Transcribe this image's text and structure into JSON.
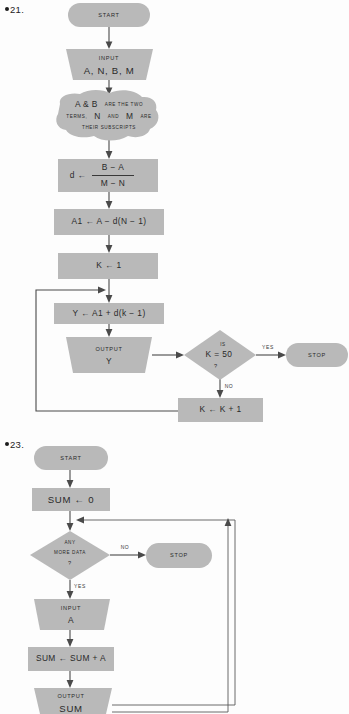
{
  "page": {
    "width": 349,
    "height": 714,
    "background": "#fdfdfd",
    "shape_fill": "#b9b9b9",
    "connector_color": "#4a4a4a",
    "text_color": "#2a2a2a"
  },
  "problems": [
    {
      "number": "21.",
      "bullet": "●",
      "nodes": {
        "start": {
          "label": "START",
          "shape": "terminator"
        },
        "input": {
          "line1": "INPUT",
          "line2": "A, N, B, M",
          "shape": "trapezoid-io"
        },
        "annotation": {
          "line1_a": "A & B",
          "line1_b": "ARE THE TWO",
          "line2_a": "TERMS,",
          "line2_b": "N",
          "line2_c": "AND",
          "line2_d": "M",
          "line2_e": "ARE",
          "line3": "THEIR SUBSCRIPTS",
          "shape": "blob"
        },
        "formula_d": {
          "lhs": "d ←",
          "numerator": "B − A",
          "denominator": "M − N",
          "shape": "process"
        },
        "assign_a1": {
          "label": "A1 ← A − d(N − 1)",
          "shape": "process"
        },
        "init_k": {
          "label": "K ← 1",
          "shape": "process"
        },
        "compute_y": {
          "label": "Y ← A1 + d(k − 1)",
          "shape": "process"
        },
        "output_y": {
          "line1": "OUTPUT",
          "line2": "Y",
          "shape": "trapezoid-io"
        },
        "decision": {
          "top": "IS",
          "middle": "K = 50",
          "bottom": "?",
          "shape": "diamond"
        },
        "stop": {
          "label": "STOP",
          "shape": "terminator"
        },
        "increment_k": {
          "label": "K ← K + 1",
          "shape": "process"
        }
      },
      "edge_labels": {
        "yes": "YES",
        "no": "NO"
      }
    },
    {
      "number": "23.",
      "bullet": "●",
      "nodes": {
        "start": {
          "label": "START",
          "shape": "terminator"
        },
        "init_sum": {
          "label": "SUM  ←  0",
          "shape": "process"
        },
        "decision": {
          "line1": "ANY",
          "line2": "MORE DATA",
          "line3": "?",
          "shape": "diamond"
        },
        "stop": {
          "label": "STOP",
          "shape": "terminator"
        },
        "input": {
          "line1": "INPUT",
          "line2": "A",
          "shape": "trapezoid-io"
        },
        "accumulate": {
          "label": "SUM ← SUM + A",
          "shape": "process"
        },
        "output_sum": {
          "line1": "OUTPUT",
          "line2": "SUM",
          "shape": "trapezoid-io"
        }
      },
      "edge_labels": {
        "yes": "YES",
        "no": "NO"
      }
    }
  ]
}
